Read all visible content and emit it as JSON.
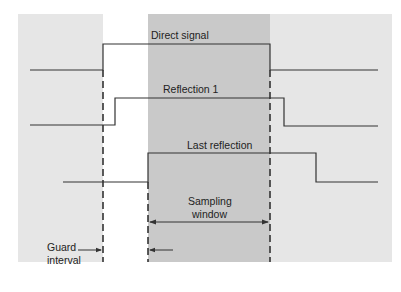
{
  "diagram": {
    "type": "timing-diagram",
    "colors": {
      "background": "#ffffff",
      "guard_band": "#e6e6e6",
      "sampling_window": "#c9c9c9",
      "line": "#333333"
    },
    "labels": {
      "direct_signal": "Direct signal",
      "reflection_1": "Reflection 1",
      "last_reflection": "Last reflection",
      "sampling_window_line1": "Sampling",
      "sampling_window_line2": "window",
      "guard_interval_line1": "Guard",
      "guard_interval_line2": "interval"
    },
    "signals": [
      {
        "name": "Direct signal",
        "low_y": 70,
        "high_y": 44,
        "start_x": 30,
        "rise_x": 103,
        "fall_x": 270,
        "end_x": 378
      },
      {
        "name": "Reflection 1",
        "low_y": 125,
        "high_y": 98,
        "start_x": 30,
        "rise_x": 115,
        "fall_x": 284,
        "end_x": 378
      },
      {
        "name": "Last reflection",
        "low_y": 182,
        "high_y": 153,
        "start_x": 63,
        "rise_x": 148,
        "fall_x": 316,
        "end_x": 378
      }
    ]
  }
}
